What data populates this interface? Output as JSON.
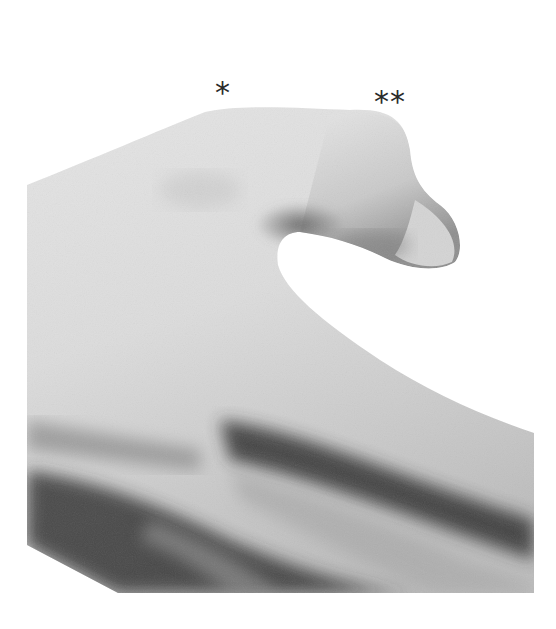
{
  "figure": {
    "markers": [
      {
        "label": "*"
      },
      {
        "label": "**"
      }
    ],
    "colors": {
      "background": "#ffffff",
      "skin_light": "#e4e4e4",
      "skin_mid": "#b8b8b8",
      "skin_dark": "#3a3a3a"
    }
  }
}
